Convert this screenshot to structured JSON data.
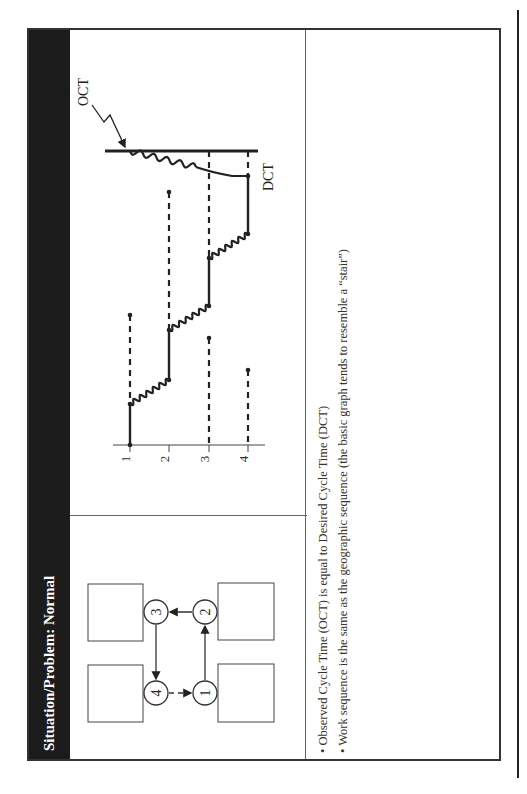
{
  "header": {
    "title": "Situation/Problem: Normal"
  },
  "layout_diagram": {
    "stations": [
      {
        "id": "1",
        "label": "1"
      },
      {
        "id": "2",
        "label": "2"
      },
      {
        "id": "3",
        "label": "3"
      },
      {
        "id": "4",
        "label": "4"
      }
    ],
    "flow": [
      "1 → 2 (solid)",
      "2 → 3 (solid)",
      "3 → 4 (solid)",
      "4 → 1 (dashed)"
    ]
  },
  "graph": {
    "oct_label": "OCT",
    "dct_label": "DCT",
    "x_ticks": [
      "1",
      "2",
      "3",
      "4"
    ]
  },
  "bullets": [
    "Observed Cycle Time (OCT) is equal to Desired Cycle Time (DCT)",
    "Work sequence is the same as the geographic sequence (the basic graph tends to resemble a “stair”)"
  ],
  "colors": {
    "header_bg": "#1c1c1c",
    "header_text": "#ffffff",
    "line": "#222222"
  }
}
